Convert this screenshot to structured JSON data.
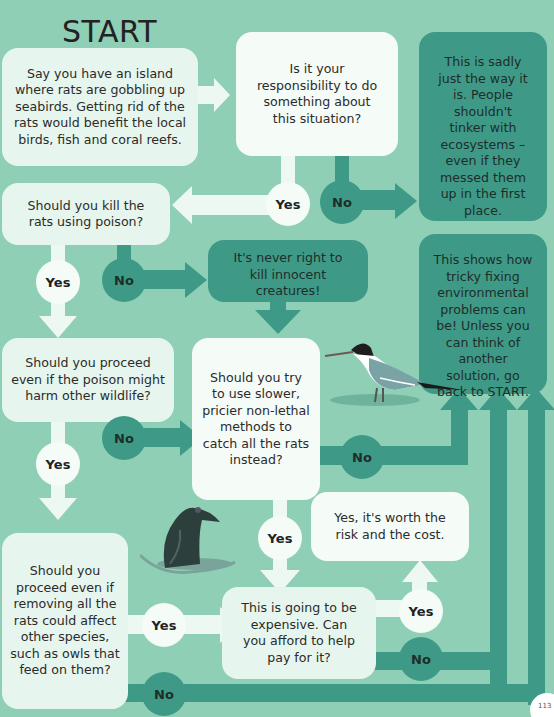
{
  "title": "START",
  "colors": {
    "background": "#8fcfb6",
    "light_box": "#e6f6ee",
    "dark_box": "#3e9a87",
    "yes_circle": "#f5fbf7"
  },
  "nodes": {
    "intro": "Say you have an island where rats are gobbling up seabirds. Getting rid of the rats would benefit the local birds, fish and coral reefs.",
    "responsibility": "Is it your responsibility to do something about this situation?",
    "sadly_way": "This is sadly just the way it is. People shouldn't tinker with ecosystems – even if they messed them up in the first place.",
    "kill_poison": "Should you kill the rats using poison?",
    "never_right": "It's never right to kill innocent creatures!",
    "tricky": "This shows how tricky fixing environmental problems can be! Unless you can think of another solution, go back to START.",
    "harm_wildlife": "Should you proceed even if the poison might harm other wildlife?",
    "non_lethal": "Should you try to use slower, pricier non-lethal methods to catch all the rats instead?",
    "worth_risk": "Yes, it's worth the risk and the cost.",
    "affect_species": "Should you proceed even if removing all the rats could affect other species, such as owls that feed on them?",
    "expensive": "This is going to be expensive. Can you afford to help pay for it?"
  },
  "labels": {
    "yes": "Yes",
    "no": "No"
  },
  "illustrations": [
    "seabird",
    "rat"
  ],
  "page_number": "113"
}
